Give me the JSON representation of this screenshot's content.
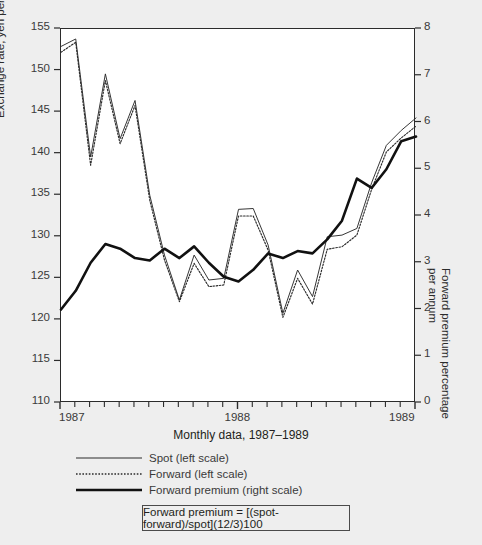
{
  "figure": {
    "background_color": "#eeeeee",
    "plot_background_color": "#ffffff",
    "axis_color": "#2b2b2b"
  },
  "axes": {
    "left_axis_title": "Exchange rate, yen per U.S. dollar",
    "right_axis_title_line1": "Forward premium percentage",
    "right_axis_title_line2": "per annum",
    "x_caption": "Monthly data, 1987–1989",
    "left_ticks": [
      "155",
      "150",
      "145",
      "140",
      "135",
      "130",
      "125",
      "120",
      "115",
      "110"
    ],
    "right_ticks": [
      "8",
      "7",
      "6",
      "5",
      "4",
      "3",
      "2",
      "1",
      "0"
    ],
    "x_ticks": [
      "1987",
      "1988",
      "1989"
    ]
  },
  "legend": {
    "items": [
      {
        "label": "Spot (left scale)",
        "style": "solid-thin",
        "color": "#2b2b2b"
      },
      {
        "label": "Forward (left scale)",
        "style": "dotted",
        "color": "#2b2b2b"
      },
      {
        "label": "Forward premium (right scale)",
        "style": "solid-thick",
        "color": "#111111"
      }
    ]
  },
  "formula": {
    "text": "Forward premium = [(spot-forward)/spot](12/3)100"
  },
  "chart_data": {
    "type": "line",
    "title": "",
    "subtitle": "",
    "xlabel": "Monthly data, 1987–1989",
    "ylabel": "Exchange rate, yen per U.S. dollar",
    "ylabel_right": "Forward premium percentage per annum",
    "xlim": [
      1987.0,
      1989.0
    ],
    "ylim": [
      110,
      155
    ],
    "ylim_right": [
      0,
      8
    ],
    "grid": false,
    "legend_position": "below-left",
    "x": [
      1987.0,
      1987.083,
      1987.167,
      1987.25,
      1987.333,
      1987.417,
      1987.5,
      1987.583,
      1987.667,
      1987.75,
      1987.833,
      1987.917,
      1988.0,
      1988.083,
      1988.167,
      1988.25,
      1988.333,
      1988.417,
      1988.5,
      1988.583,
      1988.667,
      1988.75,
      1988.833,
      1988.917,
      1989.0
    ],
    "x_tick_labels": [
      "1987",
      "1988",
      "1989"
    ],
    "series": [
      {
        "name": "Spot (left scale)",
        "axis": "left",
        "style": "solid-thin",
        "values": [
          152.9,
          153.8,
          139.6,
          149.6,
          141.8,
          146.4,
          135.0,
          127.8,
          122.4,
          127.8,
          124.8,
          125.0,
          133.3,
          133.4,
          129.0,
          120.8,
          126.0,
          122.8,
          130.0,
          130.2,
          131.0,
          136.5,
          141.0,
          142.8,
          144.3
        ]
      },
      {
        "name": "Forward (left scale)",
        "axis": "left",
        "style": "dotted",
        "values": [
          152.2,
          153.4,
          138.6,
          148.8,
          141.2,
          145.8,
          134.4,
          127.2,
          122.2,
          126.8,
          124.0,
          124.2,
          132.5,
          132.5,
          128.4,
          120.3,
          125.0,
          121.9,
          128.5,
          128.8,
          130.2,
          135.7,
          140.2,
          141.9,
          143.3
        ]
      },
      {
        "name": "Forward premium (right scale)",
        "axis": "right",
        "style": "solid-thick",
        "values": [
          2.0,
          2.4,
          3.0,
          3.4,
          3.3,
          3.1,
          3.05,
          3.3,
          3.1,
          3.35,
          3.0,
          2.7,
          2.6,
          2.85,
          3.2,
          3.1,
          3.25,
          3.2,
          3.5,
          3.9,
          4.8,
          4.6,
          5.0,
          5.6,
          5.7
        ],
        "values_tail_note": "declines to about 3.9 at the right edge"
      }
    ]
  }
}
